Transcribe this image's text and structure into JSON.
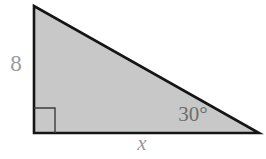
{
  "figure": {
    "labels": {
      "vertical_side": "8",
      "base_side": "x",
      "angle": "30°"
    },
    "colors": {
      "background": "#ffffff",
      "triangle_fill": "#c8c8c8",
      "triangle_edge": "#151515",
      "right_angle_marker": "#3c3c3c",
      "outer_label": "#9a9a9a",
      "inner_label": "#6e6e6e"
    }
  }
}
